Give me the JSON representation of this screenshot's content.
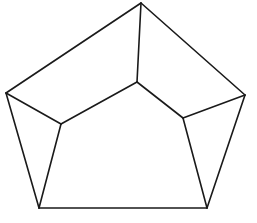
{
  "diagram": {
    "type": "line-drawing",
    "stroke_color": "#1a1a1a",
    "background": "#ffffff",
    "vertices": {
      "outer_top": [
        141,
        3
      ],
      "outer_right": [
        245,
        95
      ],
      "outer_bottom_right": [
        207,
        208
      ],
      "outer_bottom_left": [
        39,
        208
      ],
      "outer_left": [
        6,
        93
      ],
      "inner_top": [
        137,
        82
      ],
      "inner_right": [
        183,
        118
      ],
      "inner_left": [
        61,
        124
      ]
    },
    "edges": [
      [
        "outer_top",
        "outer_right"
      ],
      [
        "outer_right",
        "outer_bottom_right"
      ],
      [
        "outer_bottom_right",
        "outer_bottom_left"
      ],
      [
        "outer_bottom_left",
        "outer_left"
      ],
      [
        "outer_left",
        "outer_top"
      ],
      [
        "outer_top",
        "inner_top"
      ],
      [
        "inner_top",
        "inner_right"
      ],
      [
        "inner_top",
        "inner_left"
      ],
      [
        "inner_right",
        "outer_right"
      ],
      [
        "inner_right",
        "outer_bottom_right"
      ],
      [
        "inner_left",
        "outer_left"
      ],
      [
        "inner_left",
        "outer_bottom_left"
      ]
    ]
  }
}
